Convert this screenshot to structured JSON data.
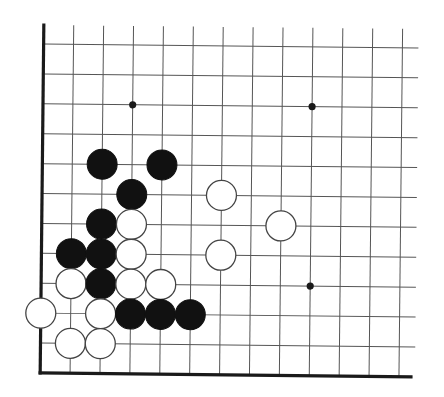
{
  "board": {
    "title": "Go board diagram (lower-left corner)",
    "board_size": 19,
    "visible_columns": 13,
    "visible_rows": 12,
    "edges": [
      "left",
      "bottom"
    ],
    "colors": {
      "background": "#ffffff",
      "grid": "#555555",
      "edge": "#1a1a1a",
      "black_stone": "#111111",
      "white_stone": "#ffffff",
      "white_outline": "#444444"
    },
    "star_points": [
      {
        "col": 3,
        "row": 2
      },
      {
        "col": 9,
        "row": 2
      },
      {
        "col": 9,
        "row": 8
      }
    ],
    "stones": [
      {
        "color": "black",
        "col": 2,
        "row": 4
      },
      {
        "color": "black",
        "col": 4,
        "row": 4
      },
      {
        "color": "black",
        "col": 3,
        "row": 5
      },
      {
        "color": "white",
        "col": 6,
        "row": 5
      },
      {
        "color": "black",
        "col": 2,
        "row": 6
      },
      {
        "color": "white",
        "col": 3,
        "row": 6
      },
      {
        "color": "white",
        "col": 8,
        "row": 6
      },
      {
        "color": "black",
        "col": 1,
        "row": 7
      },
      {
        "color": "black",
        "col": 2,
        "row": 7
      },
      {
        "color": "white",
        "col": 3,
        "row": 7
      },
      {
        "color": "white",
        "col": 6,
        "row": 7
      },
      {
        "color": "white",
        "col": 1,
        "row": 8
      },
      {
        "color": "black",
        "col": 2,
        "row": 8
      },
      {
        "color": "white",
        "col": 3,
        "row": 8
      },
      {
        "color": "white",
        "col": 4,
        "row": 8
      },
      {
        "color": "white",
        "col": 0,
        "row": 9
      },
      {
        "color": "white",
        "col": 2,
        "row": 9
      },
      {
        "color": "black",
        "col": 3,
        "row": 9
      },
      {
        "color": "black",
        "col": 4,
        "row": 9
      },
      {
        "color": "black",
        "col": 5,
        "row": 9
      },
      {
        "color": "white",
        "col": 1,
        "row": 10
      },
      {
        "color": "white",
        "col": 2,
        "row": 10
      }
    ]
  }
}
